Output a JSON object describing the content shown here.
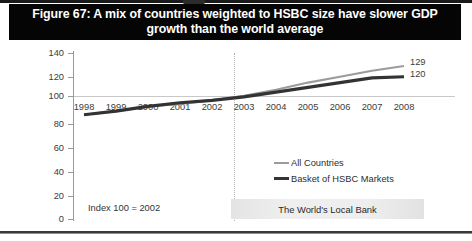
{
  "figure": {
    "title": "Figure 67: A mix of countries weighted to HSBC size have slower GDP growth than the world average",
    "note": "Index 100 = 2002",
    "banner": "The World's Local Bank"
  },
  "colors": {
    "title_background": "#050505",
    "title_text": "#ffffff",
    "all_countries_line": "#9b9b9b",
    "hsbc_basket_line": "#333333",
    "gridline": "#c8c8c8",
    "axis": "#9a9a9a",
    "banner_background": "#ebebeb"
  },
  "chart_data": {
    "type": "line",
    "title": "Figure 67: A mix of countries weighted to HSBC size have slower GDP growth than the world average",
    "xlabel": "",
    "ylabel": "",
    "x": [
      1998,
      1999,
      2000,
      2001,
      2002,
      2003,
      2004,
      2005,
      2006,
      2007,
      2008
    ],
    "categories": [
      "1998",
      "1999",
      "2000",
      "2001",
      "2002",
      "2003",
      "2004",
      "2005",
      "2006",
      "2007",
      "2008"
    ],
    "ylim": [
      0,
      140
    ],
    "yticks": [
      0,
      20,
      40,
      60,
      80,
      100,
      120,
      140
    ],
    "ytick_labels": [
      "0",
      "20",
      "40",
      "60",
      "80",
      "100",
      "120",
      "140"
    ],
    "grid": "horizontal gridline at 100 only",
    "legend_position": "center",
    "annotations": [
      {
        "text": "Index 100 = 2002",
        "x": 1998.2,
        "y": 14
      },
      {
        "text": "The World's Local Bank",
        "x": 2002.9,
        "y": 9
      },
      {
        "text": "vertical dotted divider between 2002 and 2003",
        "x": 2002.5,
        "y": 70
      }
    ],
    "series": [
      {
        "name": "All Countries",
        "color": "#9b9b9b",
        "style": "thin",
        "values": [
          88,
          91,
          95,
          97,
          100,
          104,
          109,
          115,
          120,
          125,
          129
        ],
        "end_label": "129"
      },
      {
        "name": "Basket of HSBC Markets",
        "color": "#333333",
        "style": "thick",
        "values": [
          88,
          91,
          95,
          98,
          100,
          103,
          107,
          111,
          115,
          119,
          120
        ],
        "end_label": "120"
      }
    ]
  },
  "legend": {
    "items": [
      {
        "label": "All Countries"
      },
      {
        "label": "Basket of HSBC Markets"
      }
    ]
  },
  "end_labels": {
    "all_countries": "129",
    "hsbc_basket": "120"
  },
  "y_axis": {
    "ticks": [
      "140",
      "120",
      "100",
      "80",
      "60",
      "40",
      "20",
      "0"
    ]
  },
  "x_axis": {
    "ticks": [
      "1998",
      "1999",
      "2000",
      "2001",
      "2002",
      "2003",
      "2004",
      "2005",
      "2006",
      "2007",
      "2008"
    ]
  }
}
